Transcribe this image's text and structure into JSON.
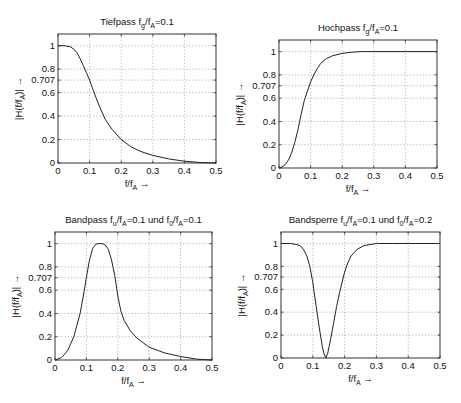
{
  "figure": {
    "background": "#ffffff",
    "line_color": "#222222",
    "grid_color": "#999999"
  },
  "chart_data": [
    {
      "id": "tiefpass",
      "type": "line",
      "title": "Tiefpass",
      "title_parts": [
        {
          "t": "Tiefpass f",
          "s": "n"
        },
        {
          "t": "g",
          "s": "sub"
        },
        {
          "t": "/f",
          "s": "n"
        },
        {
          "t": "A",
          "s": "sub"
        },
        {
          "t": "=0.1",
          "s": "n"
        }
      ],
      "xlabel": "f/f_A →",
      "ylabel": "|H(f/f_A)| →",
      "xlim": [
        0,
        0.5
      ],
      "ylim": [
        0,
        1.1
      ],
      "xticks": [
        0,
        0.1,
        0.2,
        0.3,
        0.4,
        0.5
      ],
      "xtick_labels": [
        "0",
        "0.1",
        "0.2",
        "0.3",
        "0.4",
        "0.5"
      ],
      "yticks": [
        0,
        0.2,
        0.4,
        0.6,
        0.707,
        0.8,
        1
      ],
      "ytick_labels": [
        "0",
        "0.2",
        "0.4",
        "0.6",
        "0.707",
        "0.8",
        "1"
      ],
      "grid": true,
      "box": {
        "x": 58,
        "y": 34,
        "w": 158,
        "h": 129
      },
      "x": [
        0,
        0.02,
        0.04,
        0.05,
        0.06,
        0.07,
        0.08,
        0.09,
        0.1,
        0.11,
        0.12,
        0.13,
        0.14,
        0.15,
        0.17,
        0.2,
        0.23,
        0.26,
        0.3,
        0.35,
        0.4,
        0.45,
        0.5
      ],
      "values": [
        1,
        1,
        0.99,
        0.97,
        0.94,
        0.89,
        0.83,
        0.77,
        0.707,
        0.63,
        0.56,
        0.49,
        0.43,
        0.37,
        0.29,
        0.2,
        0.14,
        0.1,
        0.065,
        0.035,
        0.015,
        0.004,
        0
      ]
    },
    {
      "id": "hochpass",
      "type": "line",
      "title": "Hochpass",
      "title_parts": [
        {
          "t": "Hochpass f",
          "s": "n"
        },
        {
          "t": "g",
          "s": "sub"
        },
        {
          "t": "/f",
          "s": "n"
        },
        {
          "t": "A",
          "s": "sub"
        },
        {
          "t": "=0.1",
          "s": "n"
        }
      ],
      "xlabel": "f/f_A →",
      "ylabel": "|H(f/f_A)| →",
      "xlim": [
        0,
        0.5
      ],
      "ylim": [
        0,
        1.1
      ],
      "xticks": [
        0,
        0.1,
        0.2,
        0.3,
        0.4,
        0.5
      ],
      "xtick_labels": [
        "0",
        "0.1",
        "0.2",
        "0.3",
        "0.4",
        "0.5"
      ],
      "yticks": [
        0,
        0.2,
        0.4,
        0.6,
        0.707,
        0.8,
        1
      ],
      "ytick_labels": [
        "0",
        "0.2",
        "0.4",
        "0.6",
        "0.707",
        "0.8",
        "1"
      ],
      "grid": true,
      "box": {
        "x": 279,
        "y": 40,
        "w": 158,
        "h": 128
      },
      "x": [
        0,
        0.01,
        0.02,
        0.03,
        0.04,
        0.05,
        0.06,
        0.07,
        0.08,
        0.09,
        0.1,
        0.11,
        0.12,
        0.13,
        0.14,
        0.15,
        0.17,
        0.2,
        0.23,
        0.26,
        0.3,
        0.4,
        0.5
      ],
      "values": [
        0,
        0.01,
        0.03,
        0.07,
        0.13,
        0.22,
        0.33,
        0.46,
        0.58,
        0.66,
        0.74,
        0.8,
        0.85,
        0.89,
        0.92,
        0.94,
        0.965,
        0.985,
        0.995,
        1,
        1,
        1,
        1
      ]
    },
    {
      "id": "bandpass",
      "type": "line",
      "title": "Bandpass",
      "title_parts": [
        {
          "t": "Bandpass f",
          "s": "n"
        },
        {
          "t": "u",
          "s": "sub"
        },
        {
          "t": "/f",
          "s": "n"
        },
        {
          "t": "A",
          "s": "sub"
        },
        {
          "t": "=0.1 und f",
          "s": "n"
        },
        {
          "t": "0",
          "s": "sub"
        },
        {
          "t": "/f",
          "s": "n"
        },
        {
          "t": "A",
          "s": "sub"
        },
        {
          "t": "=0.1",
          "s": "n"
        }
      ],
      "xlabel": "f/f_A →",
      "ylabel": "|H(f/f_A)| →",
      "xlim": [
        0,
        0.5
      ],
      "ylim": [
        0,
        1.1
      ],
      "xticks": [
        0,
        0.1,
        0.2,
        0.3,
        0.4,
        0.5
      ],
      "xtick_labels": [
        "0",
        "0.1",
        "0.2",
        "0.3",
        "0.4",
        "0.5"
      ],
      "yticks": [
        0,
        0.2,
        0.4,
        0.6,
        0.707,
        0.8,
        1
      ],
      "ytick_labels": [
        "0",
        "0.2",
        "0.4",
        "0.6",
        "0.707",
        "0.8",
        "1"
      ],
      "grid": true,
      "box": {
        "x": 55,
        "y": 232,
        "w": 157,
        "h": 128
      },
      "x": [
        0,
        0.02,
        0.04,
        0.06,
        0.08,
        0.09,
        0.1,
        0.11,
        0.12,
        0.13,
        0.14,
        0.15,
        0.16,
        0.17,
        0.18,
        0.19,
        0.2,
        0.21,
        0.22,
        0.24,
        0.26,
        0.3,
        0.35,
        0.4,
        0.45,
        0.5
      ],
      "values": [
        0,
        0.02,
        0.08,
        0.2,
        0.4,
        0.55,
        0.71,
        0.86,
        0.96,
        0.995,
        1,
        1,
        0.99,
        0.95,
        0.86,
        0.73,
        0.55,
        0.42,
        0.34,
        0.25,
        0.19,
        0.11,
        0.06,
        0.03,
        0.008,
        0
      ]
    },
    {
      "id": "bandsperre",
      "type": "line",
      "title": "Bandsperre",
      "title_parts": [
        {
          "t": "Bandsperre f",
          "s": "n"
        },
        {
          "t": "u",
          "s": "sub"
        },
        {
          "t": "/f",
          "s": "n"
        },
        {
          "t": "A",
          "s": "sub"
        },
        {
          "t": "=0.1 und f",
          "s": "n"
        },
        {
          "t": "0",
          "s": "sub"
        },
        {
          "t": "/f",
          "s": "n"
        },
        {
          "t": "A",
          "s": "sub"
        },
        {
          "t": "=0.2",
          "s": "n"
        }
      ],
      "xlabel": "f/f_A →",
      "ylabel": "|H(f/f_A)| →",
      "xlim": [
        0,
        0.5
      ],
      "ylim": [
        0,
        1.1
      ],
      "xticks": [
        0,
        0.1,
        0.2,
        0.3,
        0.4,
        0.5
      ],
      "xtick_labels": [
        "0",
        "0.1",
        "0.2",
        "0.3",
        "0.4",
        "0.5"
      ],
      "yticks": [
        0,
        0.2,
        0.4,
        0.6,
        0.707,
        0.8,
        1
      ],
      "ytick_labels": [
        "0",
        "0.2",
        "0.4",
        "0.6",
        "0.707",
        "0.8",
        "1"
      ],
      "grid": true,
      "box": {
        "x": 281,
        "y": 232,
        "w": 159,
        "h": 126
      },
      "x": [
        0,
        0.03,
        0.05,
        0.06,
        0.07,
        0.08,
        0.09,
        0.1,
        0.11,
        0.12,
        0.13,
        0.135,
        0.141,
        0.147,
        0.155,
        0.165,
        0.175,
        0.185,
        0.2,
        0.21,
        0.22,
        0.24,
        0.26,
        0.28,
        0.3,
        0.35,
        0.4,
        0.5
      ],
      "values": [
        1,
        1,
        0.99,
        0.98,
        0.95,
        0.9,
        0.81,
        0.66,
        0.46,
        0.27,
        0.1,
        0.04,
        0,
        0.04,
        0.15,
        0.3,
        0.45,
        0.58,
        0.75,
        0.83,
        0.89,
        0.95,
        0.98,
        0.99,
        1,
        1,
        1,
        1
      ]
    }
  ]
}
